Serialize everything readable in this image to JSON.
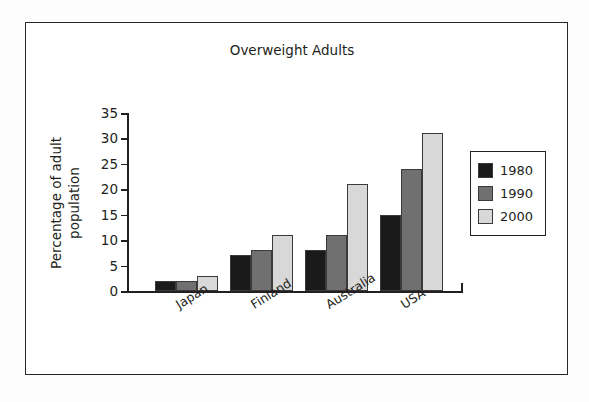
{
  "frame": {
    "border_color": "#25282b",
    "background": "#ffffff"
  },
  "chart_data": {
    "type": "bar",
    "title": "Overweight Adults",
    "xlabel": "",
    "ylabel": "Percentage of adult population",
    "ylabel_line1": "Percentage of adult",
    "ylabel_line2": "population",
    "categories": [
      "Japan",
      "Finland",
      "Australia",
      "USA"
    ],
    "series": [
      {
        "name": "1980",
        "color": "#1a1a1a",
        "values": [
          2,
          7,
          8,
          15
        ]
      },
      {
        "name": "1990",
        "color": "#707070",
        "values": [
          2,
          8,
          11,
          24
        ]
      },
      {
        "name": "2000",
        "color": "#d8d8d8",
        "values": [
          3,
          11,
          21,
          31
        ]
      }
    ],
    "ylim": [
      0,
      35
    ],
    "yticks": [
      0,
      5,
      10,
      15,
      20,
      25,
      30,
      35
    ],
    "ytick_labels": [
      "0",
      "5",
      "10",
      "15",
      "20",
      "25",
      "30",
      "35"
    ],
    "grid": false,
    "legend_position": "right",
    "axis_color": "#231f20"
  }
}
